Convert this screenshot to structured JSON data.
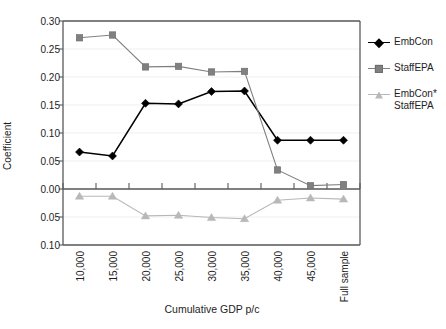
{
  "chart_data": {
    "type": "line",
    "title": "",
    "xlabel": "Cumulative GDP p/c",
    "ylabel": "Coefficient",
    "categories": [
      "10,000",
      "15,000",
      "20,000",
      "25,000",
      "30,000",
      "35,000",
      "40,000",
      "45,000",
      "Full sample"
    ],
    "ylim": [
      -0.1,
      0.3
    ],
    "yticks": [
      0.3,
      0.25,
      0.2,
      0.15,
      0.1,
      0.05,
      0.0,
      -0.05,
      -0.1
    ],
    "ytick_labels": [
      "0.30",
      "0.25",
      "0.20",
      "0.15",
      "0.10",
      "0.05",
      "0.00",
      "0.05",
      "0.10"
    ],
    "grid": "horizontal-faint",
    "legend_position": "right",
    "series": [
      {
        "name": "EmbCon",
        "marker": "diamond",
        "color": "#000000",
        "values": [
          0.066,
          0.059,
          0.153,
          0.152,
          0.174,
          0.175,
          0.087,
          0.087,
          0.087
        ]
      },
      {
        "name": "StaffEPA",
        "marker": "square",
        "color": "#808080",
        "values": [
          0.27,
          0.275,
          0.218,
          0.219,
          0.209,
          0.21,
          0.034,
          0.006,
          0.008
        ]
      },
      {
        "name": "EmbCon*StaffEPA",
        "marker": "triangle",
        "color": "#b8b8b8",
        "values": [
          -0.013,
          -0.013,
          -0.048,
          -0.047,
          -0.051,
          -0.053,
          -0.02,
          -0.016,
          -0.018
        ]
      }
    ]
  },
  "axis": {
    "ylabel": "Coefficient",
    "xlabel": "Cumulative GDP p/c",
    "ytick_labels": [
      "0.30",
      "0.25",
      "0.20",
      "0.15",
      "0.10",
      "0.05",
      "0.00",
      "0.05",
      "0.10"
    ],
    "xtick_labels": [
      "10,000",
      "15,000",
      "20,000",
      "25,000",
      "30,000",
      "35,000",
      "40,000",
      "45,000",
      "Full sample"
    ]
  },
  "legend": {
    "items": [
      {
        "label": "EmbCon",
        "marker": "diamond-icon",
        "color": "#000000"
      },
      {
        "label": "StaffEPA",
        "marker": "square-icon",
        "color": "#808080"
      },
      {
        "label": "EmbCon*\nStaffEPA",
        "marker": "triangle-icon",
        "color": "#b8b8b8"
      }
    ]
  },
  "colors": {
    "series1": "#000000",
    "series2": "#808080",
    "series3": "#b8b8b8",
    "frame": "#595959",
    "grid": "#efefef",
    "text": "#1d1d1d"
  }
}
